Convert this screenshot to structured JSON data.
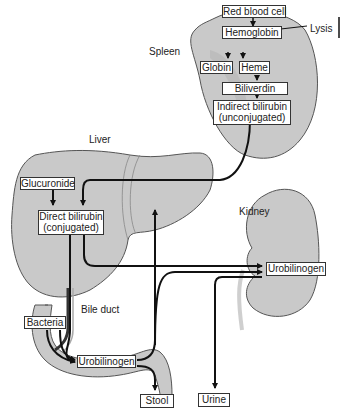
{
  "diagram": {
    "organs": {
      "spleen": "Spleen",
      "liver": "Liver",
      "kidney": "Kidney",
      "bile_duct": "Bile duct"
    },
    "annotations": {
      "lysis": "Lysis"
    },
    "nodes": {
      "red_blood_cell": "Red blood cell",
      "hemoglobin": "Hemoglobin",
      "globin": "Globin",
      "heme": "Heme",
      "biliverdin": "Biliverdin",
      "indirect_bilirubin_1": "Indirect bilirubin",
      "indirect_bilirubin_2": "(unconjugated)",
      "glucuronide": "Glucuronide",
      "direct_bilirubin_1": "Direct bilirubin",
      "direct_bilirubin_2": "(conjugated)",
      "bacteria": "Bacteria",
      "urobilinogen_gut": "Urobilinogen",
      "urobilinogen_kidney": "Urobilinogen",
      "stool": "Stool",
      "urine": "Urine"
    },
    "edges": [
      {
        "from": "Red blood cell",
        "to": "Hemoglobin"
      },
      {
        "from": "Hemoglobin",
        "to": "Globin"
      },
      {
        "from": "Hemoglobin",
        "to": "Heme"
      },
      {
        "from": "Heme",
        "to": "Biliverdin"
      },
      {
        "from": "Biliverdin",
        "to": "Indirect bilirubin (unconjugated)"
      },
      {
        "from": "Indirect bilirubin (unconjugated)",
        "to": "Direct bilirubin (conjugated)"
      },
      {
        "from": "Glucuronide",
        "to": "Direct bilirubin (conjugated)"
      },
      {
        "from": "Direct bilirubin (conjugated)",
        "to": "Urobilinogen (kidney)"
      },
      {
        "from": "Direct bilirubin (conjugated)",
        "to": "Urobilinogen (gut)",
        "via": "Bile duct"
      },
      {
        "from": "Bacteria",
        "to": "Urobilinogen (gut)"
      },
      {
        "from": "Urobilinogen (gut)",
        "to": "Liver"
      },
      {
        "from": "Urobilinogen (gut)",
        "to": "Urobilinogen (kidney)"
      },
      {
        "from": "Urobilinogen (gut)",
        "to": "Stool"
      },
      {
        "from": "Urobilinogen (kidney)",
        "to": "Urine"
      }
    ],
    "colors": {
      "organ_fill": "#c8c8c8",
      "organ_stroke": "#555555",
      "arrow": "#111111"
    }
  }
}
